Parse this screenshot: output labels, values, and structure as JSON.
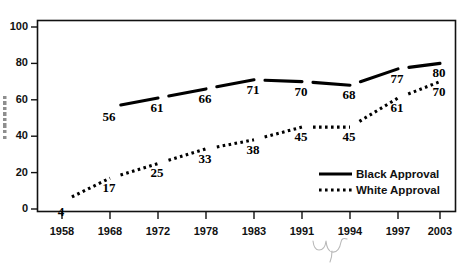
{
  "chart_data": {
    "type": "line",
    "title": "",
    "subtitle": "",
    "xlabel": "",
    "ylabel": "",
    "categories": [
      "1958",
      "1968",
      "1972",
      "1978",
      "1983",
      "1991",
      "1994",
      "1997",
      "2003"
    ],
    "ylim": [
      0,
      100
    ],
    "y_ticks": [
      "0",
      "20",
      "40",
      "60",
      "80",
      "100"
    ],
    "grid": false,
    "legend_position": "inside-bottom-right",
    "series": [
      {
        "name": "Black Approval",
        "style": "solid",
        "color": "#000000",
        "values": [
          null,
          56,
          61,
          66,
          71,
          70,
          68,
          77,
          80
        ],
        "labels": [
          "",
          "56",
          "61",
          "66",
          "71",
          "70",
          "68",
          "77",
          "80"
        ]
      },
      {
        "name": "White Approval",
        "style": "dotted",
        "color": "#000000",
        "values": [
          4,
          17,
          25,
          33,
          38,
          45,
          45,
          61,
          70
        ],
        "labels": [
          "4",
          "17",
          "25",
          "33",
          "38",
          "45",
          "45",
          "61",
          "70"
        ]
      }
    ]
  },
  "legend": {
    "items": [
      {
        "label": "Black Approval",
        "style": "solid"
      },
      {
        "label": "White Approval",
        "style": "dotted"
      }
    ]
  },
  "axes": {
    "y_tick_labels": [
      "100",
      "80",
      "60",
      "40",
      "20",
      "0"
    ],
    "x_tick_labels": [
      "1958",
      "1968",
      "1972",
      "1978",
      "1983",
      "1991",
      "1994",
      "1997",
      "2003"
    ]
  }
}
